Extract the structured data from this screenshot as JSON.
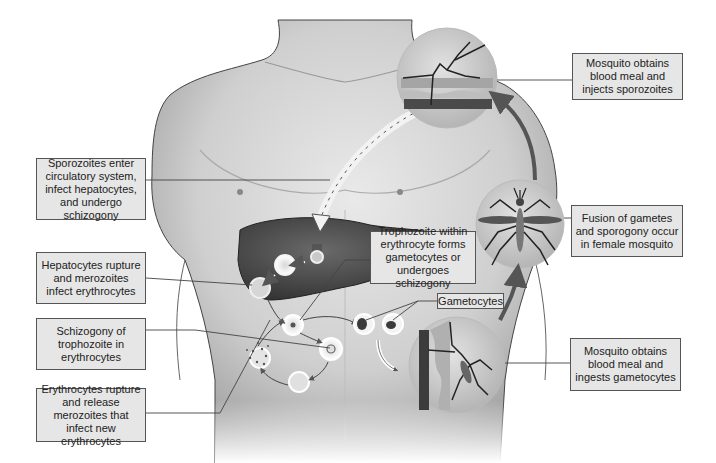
{
  "labels": {
    "sporozoites_enter": "Sporozoites enter circulatory system, infect hepatocytes, and undergo schizogony",
    "hepatocytes_rupture": "Hepatocytes rupture and merozoites infect erythrocytes",
    "schizogony_trophozoite": "Schizogony of trophozoite in erythrocytes",
    "erythrocytes_rupture": "Erythrocytes rupture and release merozoites that infect new erythrocytes",
    "trophozoite_within": "Trophozoite within erythrocyte forms gametocytes or undergoes schizogony",
    "gametocytes": "Gametocytes",
    "mosquito_injects": "Mosquito obtains blood meal and injects sporozoites",
    "fusion_gametes": "Fusion of gametes and sporogony occur in female mosquito",
    "mosquito_ingests": "Mosquito obtains blood meal and ingests gametocytes"
  },
  "colors": {
    "label_bg": "#e6e6e6",
    "label_border": "#555555",
    "skin_light": "#e8e8e8",
    "skin_shade": "#a9a9a9",
    "liver": "#4a4a4a",
    "arrow": "#555555",
    "circle_bg": "#c9c9c9"
  }
}
